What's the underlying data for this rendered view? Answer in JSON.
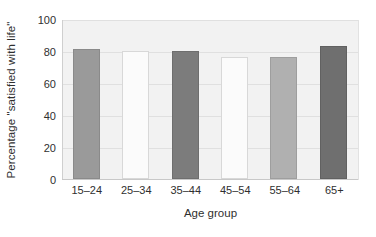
{
  "chart_data": {
    "type": "bar",
    "title": "",
    "xlabel": "Age group",
    "ylabel": "Percentage \"satisfied with life\"",
    "categories": [
      "15–24",
      "25–34",
      "35–44",
      "45–54",
      "55–64",
      "65+"
    ],
    "values": [
      81,
      80,
      80,
      76,
      76,
      83
    ],
    "bar_colors": [
      "#9a9a9a",
      "#fbfbfb",
      "#7c7c7c",
      "#fbfbfb",
      "#b0b0b0",
      "#6f6f6f"
    ],
    "bar_border_colors": [
      "#8a8a8a",
      "#d8d8d8",
      "#6e6e6e",
      "#d8d8d8",
      "#9e9e9e",
      "#616161"
    ],
    "ylim": [
      0,
      100
    ],
    "yticks": [
      0,
      20,
      40,
      60,
      80,
      100
    ],
    "ytick_labels": [
      "0",
      "20",
      "40",
      "60",
      "80",
      "100"
    ],
    "grid": true,
    "grid_color": "#e0e0e0",
    "legend": "none",
    "plot_background": "#f2f2f2",
    "figure_background": "#ffffff",
    "text_color": "#2f2f2f"
  }
}
